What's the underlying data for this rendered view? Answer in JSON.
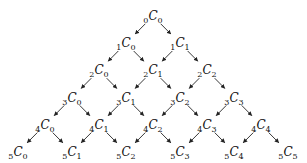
{
  "diagram": {
    "symbol": "C",
    "rows": [
      [
        {
          "n": "0",
          "k": "0"
        }
      ],
      [
        {
          "n": "1",
          "k": "0"
        },
        {
          "n": "1",
          "k": "1"
        }
      ],
      [
        {
          "n": "2",
          "k": "0"
        },
        {
          "n": "2",
          "k": "1"
        },
        {
          "n": "2",
          "k": "2"
        }
      ],
      [
        {
          "n": "3",
          "k": "0"
        },
        {
          "n": "3",
          "k": "1"
        },
        {
          "n": "3",
          "k": "2"
        },
        {
          "n": "3",
          "k": "3"
        }
      ],
      [
        {
          "n": "4",
          "k": "0"
        },
        {
          "n": "4",
          "k": "1"
        },
        {
          "n": "4",
          "k": "2"
        },
        {
          "n": "4",
          "k": "3"
        },
        {
          "n": "4",
          "k": "4"
        }
      ],
      [
        {
          "n": "5",
          "k": "0"
        },
        {
          "n": "5",
          "k": "1"
        },
        {
          "n": "5",
          "k": "2"
        },
        {
          "n": "5",
          "k": "3"
        },
        {
          "n": "5",
          "k": "4"
        },
        {
          "n": "5",
          "k": "5"
        }
      ]
    ],
    "edges": "each nCk has an arrow to (n+1)C(k) down-left and (n+1)C(k+1) down-right",
    "colors": {
      "text": "#111111",
      "arrow": "#222222",
      "background": "#ffffff"
    }
  }
}
